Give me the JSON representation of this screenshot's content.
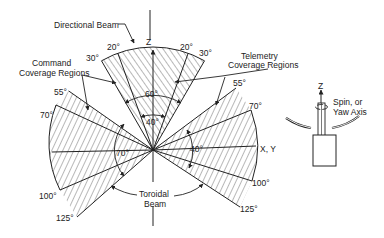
{
  "diagram": {
    "labels": {
      "directional_beam": "Directional Beam",
      "command_line1": "Command",
      "command_line2": "Coverage Regions",
      "telemetry_line1": "Telemetry",
      "telemetry_line2": "Coverage Regions",
      "toroidal_line1": "Toroidal",
      "toroidal_line2": "Beam",
      "z_axis": "Z",
      "xy_axis": "X, Y",
      "spin_line1": "Spin, or",
      "spin_line2": "Yaw Axis",
      "spin_z": "Z"
    },
    "angles": {
      "top_left_20": "20°",
      "top_right_20": "20°",
      "top_left_30": "30°",
      "top_right_30": "30°",
      "beam_60": "60°",
      "beam_40": "40°",
      "left_55": "55°",
      "left_70": "70°",
      "left_100": "100°",
      "left_125": "125°",
      "left_band": "70°",
      "right_55": "55°",
      "right_70": "70°",
      "right_100": "100°",
      "right_125": "125°",
      "right_band": "40°"
    },
    "colors": {
      "line": "#222222",
      "background": "#ffffff"
    }
  }
}
